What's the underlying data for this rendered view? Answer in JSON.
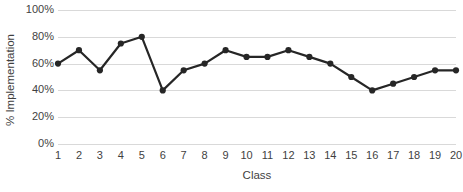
{
  "chart_data": {
    "type": "line",
    "title": "",
    "subtitle": "",
    "xlabel": "Class",
    "ylabel": "% Implementation",
    "categories": [
      "1",
      "2",
      "3",
      "4",
      "5",
      "6",
      "7",
      "8",
      "9",
      "10",
      "11",
      "12",
      "13",
      "14",
      "15",
      "16",
      "17",
      "18",
      "19",
      "20"
    ],
    "values": [
      60,
      70,
      55,
      75,
      80,
      40,
      55,
      60,
      70,
      65,
      65,
      70,
      65,
      60,
      50,
      40,
      45,
      50,
      55,
      55
    ],
    "series": [
      {
        "name": "% Implementation",
        "values": [
          60,
          70,
          55,
          75,
          80,
          40,
          55,
          60,
          70,
          65,
          65,
          70,
          65,
          60,
          50,
          40,
          45,
          50,
          55,
          55
        ]
      }
    ],
    "ylim": [
      0,
      100
    ],
    "y_ticks": [
      0,
      20,
      40,
      60,
      80,
      100
    ],
    "y_tick_labels": [
      "0%",
      "20%",
      "40%",
      "60%",
      "80%",
      "100%"
    ],
    "x_tick_labels": [
      "1",
      "2",
      "3",
      "4",
      "5",
      "6",
      "7",
      "8",
      "9",
      "10",
      "11",
      "12",
      "13",
      "14",
      "15",
      "16",
      "17",
      "18",
      "19",
      "20"
    ],
    "grid": true,
    "grid_axis": "y",
    "legend": false,
    "legend_position": "none",
    "marker": "circle",
    "line_color": "#262626",
    "marker_color": "#262626",
    "grid_color": "#d9d9d9",
    "background_color": "#ffffff",
    "text_color": "#3f3f3f"
  }
}
